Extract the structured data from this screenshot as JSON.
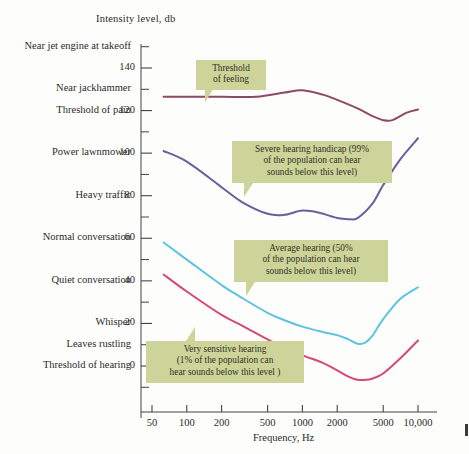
{
  "chart_data": {
    "type": "line",
    "title": "Intensity level, db",
    "xlabel": "Frequency, Hz",
    "ylabel": "Intensity level, db",
    "xscale": "log",
    "xlim": [
      45,
      11500
    ],
    "ylim": [
      -18,
      152
    ],
    "grid": false,
    "legend": "annotations",
    "xticks": [
      "50",
      "100",
      "200",
      "500",
      "1000",
      "2000",
      "5000",
      "10,000"
    ],
    "xtick_values": [
      50,
      100,
      200,
      500,
      1000,
      2000,
      5000,
      10000
    ],
    "yticks": [
      "0",
      "20",
      "40",
      "60",
      "80",
      "100",
      "120",
      "140"
    ],
    "ytick_values": [
      0,
      20,
      40,
      60,
      80,
      100,
      120,
      140
    ],
    "minor_ytick_values": [
      -10,
      10,
      30,
      50,
      70,
      90,
      110,
      130,
      150
    ],
    "series": [
      {
        "name": "Threshold of feeling",
        "color": "#8d4a64",
        "x": [
          63,
          100,
          200,
          400,
          700,
          1000,
          1500,
          2000,
          3000,
          4000,
          5000,
          6000,
          8000,
          10000
        ],
        "values": [
          126.5,
          126.5,
          126.5,
          126.5,
          128.5,
          129.5,
          127.5,
          125.0,
          121.0,
          117.5,
          115.5,
          115.5,
          119.0,
          120.5
        ]
      },
      {
        "name": "Severe hearing handicap (99% of the population can hear sounds below this level)",
        "color": "#6a5f9c",
        "x": [
          63,
          100,
          200,
          300,
          500,
          700,
          1000,
          1400,
          2000,
          2500,
          3000,
          4000,
          5000,
          7000,
          10000
        ],
        "values": [
          101.0,
          96.0,
          84.0,
          77.0,
          71.5,
          71.0,
          73.0,
          72.0,
          69.5,
          69.0,
          69.5,
          76.0,
          85.0,
          97.0,
          107.0
        ]
      },
      {
        "name": "Average hearing (50% of the population can hear sounds below this level)",
        "color": "#5ec3e0",
        "x": [
          63,
          100,
          200,
          300,
          500,
          700,
          1000,
          1500,
          2000,
          2500,
          3000,
          3500,
          4000,
          5000,
          7000,
          10000
        ],
        "values": [
          58.0,
          50.0,
          38.0,
          32.0,
          25.0,
          21.5,
          18.5,
          16.0,
          14.5,
          12.5,
          10.5,
          11.0,
          14.0,
          22.0,
          31.5,
          37.0
        ]
      },
      {
        "name": "Very sensitive hearing (1% of the population can hear sounds below this level)",
        "color": "#d4497a",
        "x": [
          63,
          100,
          200,
          300,
          500,
          700,
          1000,
          1500,
          2000,
          2500,
          3000,
          3500,
          4000,
          5000,
          7000,
          10000
        ],
        "values": [
          43.0,
          35.0,
          24.0,
          19.0,
          12.5,
          8.5,
          5.0,
          1.5,
          -2.0,
          -5.0,
          -6.5,
          -6.5,
          -6.0,
          -3.5,
          3.5,
          12.0
        ]
      }
    ],
    "source_labels": [
      {
        "text": "Near jet engine at takeoff",
        "db": 150
      },
      {
        "text": "Near jackhammer",
        "db": 130
      },
      {
        "text": "Threshold of pain",
        "db": 120
      },
      {
        "text": "Power lawnmower",
        "db": 100
      },
      {
        "text": "Heavy traffic",
        "db": 80
      },
      {
        "text": "Normal conversation",
        "db": 60
      },
      {
        "text": "Quiet conversation",
        "db": 40
      },
      {
        "text": "Whisper",
        "db": 20
      },
      {
        "text": "Leaves rustling",
        "db": 10
      },
      {
        "text": "Threshold of hearing",
        "db": 0
      }
    ],
    "annotations": [
      {
        "id": "threshold-of-feeling",
        "lines": [
          "Threshold",
          "of feeling"
        ],
        "box": {
          "x": 196,
          "y": 60,
          "w": 70,
          "h": 28
        },
        "tail": {
          "x": 205,
          "y": 88,
          "dir": "down-left"
        }
      },
      {
        "id": "severe-hearing-handicap",
        "lines": [
          "Severe hearing handicap (99%",
          "of the population can hear",
          "sounds below this level)"
        ],
        "box": {
          "x": 232,
          "y": 141,
          "w": 160,
          "h": 42
        },
        "tail": {
          "x": 244,
          "y": 183,
          "dir": "down-left"
        }
      },
      {
        "id": "average-hearing",
        "lines": [
          "Average hearing (50%",
          "of the population can hear",
          "sounds below this level)"
        ],
        "box": {
          "x": 234,
          "y": 240,
          "w": 154,
          "h": 42
        },
        "tail": {
          "x": 246,
          "y": 282,
          "dir": "down-left"
        }
      },
      {
        "id": "very-sensitive-hearing",
        "lines": [
          "Very sensitive hearing",
          "(1% of the population can",
          "hear sounds below this level )"
        ],
        "box": {
          "x": 146,
          "y": 341,
          "w": 158,
          "h": 42
        },
        "tail": {
          "x": 186,
          "y": 341,
          "dir": "up-right"
        }
      }
    ]
  },
  "axis": {
    "y_title": "Intensity level, db",
    "x_title": "Frequency, Hz"
  },
  "colors": {
    "feeling": "#8d4a64",
    "severe": "#6a5f9c",
    "average": "#5ec3e0",
    "sensitive": "#d4497a",
    "callout_bg": "#ccd49a",
    "axis": "#444444",
    "page_bg": "#fdfdfb"
  }
}
